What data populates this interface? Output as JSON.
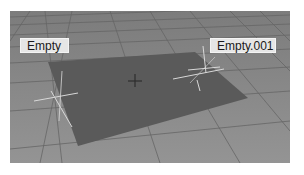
{
  "viewport": {
    "background_color": "#8a8a8a",
    "grid_line_color": "#6e6e6e",
    "plane_color": "#5c5c5c",
    "axis_color": "#d8d8d8"
  },
  "objects": [
    {
      "name": "Empty",
      "type": "empty",
      "label": "Empty"
    },
    {
      "name": "Empty.001",
      "type": "empty",
      "label": "Empty.001"
    },
    {
      "name": "Plane",
      "type": "mesh"
    }
  ],
  "labels": {
    "empty": "Empty",
    "empty_001": "Empty.001"
  },
  "cursor": {
    "type": "3d-cursor"
  }
}
